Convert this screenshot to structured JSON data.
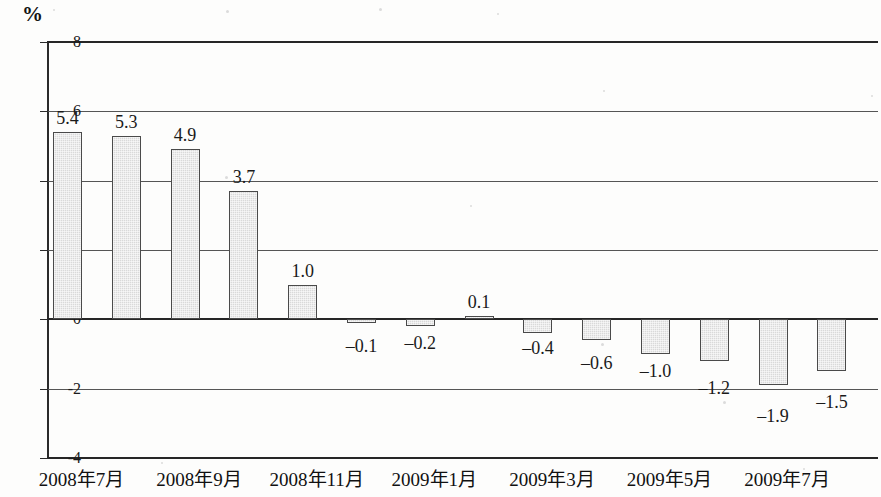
{
  "chart_data": {
    "type": "bar",
    "title": "",
    "subtitle": "",
    "unit_label": "%",
    "xlabel": "",
    "ylabel": "%",
    "ylim": [
      -4,
      8
    ],
    "grid": true,
    "legend": null,
    "y_ticks": [
      "8",
      "6",
      "4",
      "2",
      "0",
      "-2",
      "-4"
    ],
    "y_tick_values": [
      8,
      6,
      4,
      2,
      0,
      -2,
      -4
    ],
    "x_tick_labels": [
      "2008年7月",
      "2008年9月",
      "2008年11月",
      "2009年1月",
      "2009年3月",
      "2009年5月",
      "2009年7月"
    ],
    "categories": [
      "2008年7月",
      "2008年8月",
      "2008年9月",
      "2008年10月",
      "2008年11月",
      "2008年12月",
      "2009年1月",
      "2009年2月",
      "2009年3月",
      "2009年4月",
      "2009年5月",
      "2009年6月",
      "2009年7月",
      "2009年8月"
    ],
    "values": [
      5.4,
      5.3,
      4.9,
      3.7,
      1.0,
      -0.1,
      -0.2,
      0.1,
      -0.4,
      -0.6,
      -1.0,
      -1.2,
      -1.9,
      -1.5
    ],
    "data_labels": [
      "5.4",
      "5.3",
      "4.9",
      "3.7",
      "1.0",
      "-0.1",
      "-0.2",
      "0.1",
      "-0.4",
      "-0.6",
      "-1.0",
      "-1.2",
      "-1.9",
      "-1.5"
    ],
    "bar_fill_color": "#d9d9d9",
    "bar_border_color": "#4a4a4a",
    "axis_color": "#2b2b2b"
  }
}
